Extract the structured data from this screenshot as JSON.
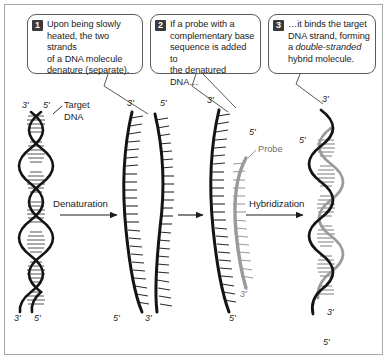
{
  "figure": {
    "background": "#ffffff",
    "frame_color": "#a8a8a8",
    "width": 387,
    "height": 359
  },
  "colors": {
    "strand_dark": "#1c1c1c",
    "strand_gray": "#9a9a9a",
    "badge_background": "#3a3a3a",
    "badge_text": "#ffffff",
    "callout_border": "#5a5a5a",
    "text": "#1c1c1c",
    "probe_label": "#6e6e6e"
  },
  "callouts": [
    {
      "number": "1",
      "text": "Upon being slowly heated, the two strands of a DNA molecule denature (separate).",
      "lines": [
        "Upon being slowly",
        "heated, the two strands",
        "of a DNA molecule",
        "denature (separate)."
      ]
    },
    {
      "number": "2",
      "text": "If a probe with a complementary base sequence is added to the denatured DNA…",
      "lines": [
        "If a probe with a",
        "complementary base",
        "sequence is added to",
        "the denatured DNA…"
      ]
    },
    {
      "number": "3",
      "text": "…it binds the target DNA strand, forming a double-stranded hybrid molecule.",
      "lines_rich": [
        {
          "plain": "…it binds the target"
        },
        {
          "plain": "DNA strand, forming"
        },
        {
          "plain": "a ",
          "italic": "double-stranded"
        },
        {
          "plain": "hybrid molecule."
        }
      ]
    }
  ],
  "labels": {
    "target_dna_line1": "Target",
    "target_dna_line2": "DNA",
    "probe": "Probe",
    "denaturation": "Denaturation",
    "hybridization": "Hybridization"
  },
  "strand_ends": {
    "duplex_top_left": "3'",
    "duplex_top_right": "5'",
    "duplex_bottom_left": "3'",
    "duplex_bottom_right": "5'",
    "denatured_a_top": "3'",
    "denatured_a_bottom": "5'",
    "denatured_b_top": "5'",
    "denatured_b_bottom": "3'",
    "target3_top": "3'",
    "target3_bottom": "5'",
    "probe_top": "5'",
    "probe_bottom": "3'",
    "hybrid_top_outer": "3'",
    "hybrid_top_inner": "5'",
    "hybrid_bottom_inner": "3'",
    "hybrid_bottom_outer": "5'"
  }
}
